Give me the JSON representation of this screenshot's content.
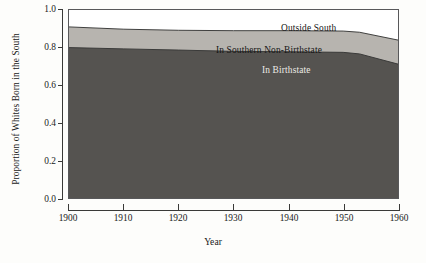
{
  "chart_data": {
    "type": "area",
    "stacked": true,
    "title": "",
    "subtitle": "",
    "xlabel": "Year",
    "ylabel": "Proportion of Whites Born in the South",
    "xlim": [
      1900,
      1960
    ],
    "ylim": [
      0.0,
      1.0
    ],
    "grid": false,
    "legend_position": "inline-annotations",
    "x": [
      1900,
      1910,
      1920,
      1930,
      1940,
      1950,
      1960
    ],
    "xticklabels": [
      "1900",
      "1910",
      "1920",
      "1930",
      "1940",
      "1950",
      "1960"
    ],
    "yticklabels": [
      "0.0",
      "0.2",
      "0.4",
      "0.6",
      "0.8",
      "1.0"
    ],
    "yticks": [
      0.0,
      0.2,
      0.4,
      0.6,
      0.8,
      1.0
    ],
    "series": [
      {
        "name": "In Birthstate",
        "color": "#555350",
        "values": [
          0.8,
          0.793,
          0.787,
          0.78,
          0.778,
          0.775,
          0.712
        ]
      },
      {
        "name": "In Southern Non-Birthstate",
        "color": "#b7b4af",
        "values": [
          0.11,
          0.105,
          0.105,
          0.11,
          0.112,
          0.113,
          0.128
        ]
      },
      {
        "name": "Outside South",
        "color": "#ffffff",
        "values": [
          0.09,
          0.102,
          0.108,
          0.11,
          0.11,
          0.112,
          0.16
        ]
      }
    ],
    "cumulative_boundaries": [
      {
        "name": "top-of-in-birthstate",
        "values": [
          0.8,
          0.793,
          0.787,
          0.78,
          0.778,
          0.775,
          0.712
        ]
      },
      {
        "name": "top-of-in-southern-non-birthstate",
        "values": [
          0.91,
          0.898,
          0.892,
          0.89,
          0.89,
          0.888,
          0.84
        ]
      }
    ],
    "annotations": [
      {
        "text": "Outside South",
        "series": "Outside South"
      },
      {
        "text": "In Southern Non-Birthstate",
        "series": "In Southern Non-Birthstate"
      },
      {
        "text": "In Birthstate",
        "series": "In Birthstate"
      }
    ]
  },
  "axes": {
    "y_title": "Proportion of Whites Born in the South",
    "x_title": "Year",
    "y_ticks": [
      "1.0",
      "0.8",
      "0.6",
      "0.4",
      "0.2",
      "0.0"
    ],
    "x_ticks": [
      "1900",
      "1910",
      "1920",
      "1930",
      "1940",
      "1950",
      "1960"
    ]
  },
  "colors": {
    "band_dark": "#555350",
    "band_light": "#b7b4af",
    "band_white": "#ffffff",
    "axis": "#3a3a38",
    "frame": "#58585a",
    "text": "#1a1a1a",
    "text_on_dark": "#eceae6",
    "page_background": "#fdfdfb"
  }
}
